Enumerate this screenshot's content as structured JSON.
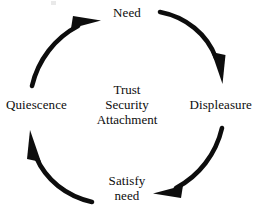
{
  "diagram": {
    "type": "cycle",
    "background_color": "#ffffff",
    "stroke_color": "#0d0d0d",
    "nodes": [
      {
        "id": "need",
        "label": "Need",
        "position": "top"
      },
      {
        "id": "displeasure",
        "label": "Displeasure",
        "position": "right"
      },
      {
        "id": "satisfy-need",
        "label_line1": "Satisfy",
        "label_line2": "need",
        "position": "bottom"
      },
      {
        "id": "quiescence",
        "label": "Quiescence",
        "position": "left"
      }
    ],
    "arrows": [
      {
        "id": "need-to-displeasure",
        "from": "need",
        "to": "displeasure",
        "arc": "top-right"
      },
      {
        "id": "displeasure-to-satisfy",
        "from": "displeasure",
        "to": "satisfy-need",
        "arc": "bottom-right"
      },
      {
        "id": "satisfy-to-quiescence",
        "from": "satisfy-need",
        "to": "quiescence",
        "arc": "bottom-left"
      },
      {
        "id": "quiescence-to-need",
        "from": "quiescence",
        "to": "need",
        "arc": "top-left"
      }
    ],
    "center_caption": {
      "line1": "Trust",
      "line2": "Security",
      "line3": "Attachment"
    }
  }
}
